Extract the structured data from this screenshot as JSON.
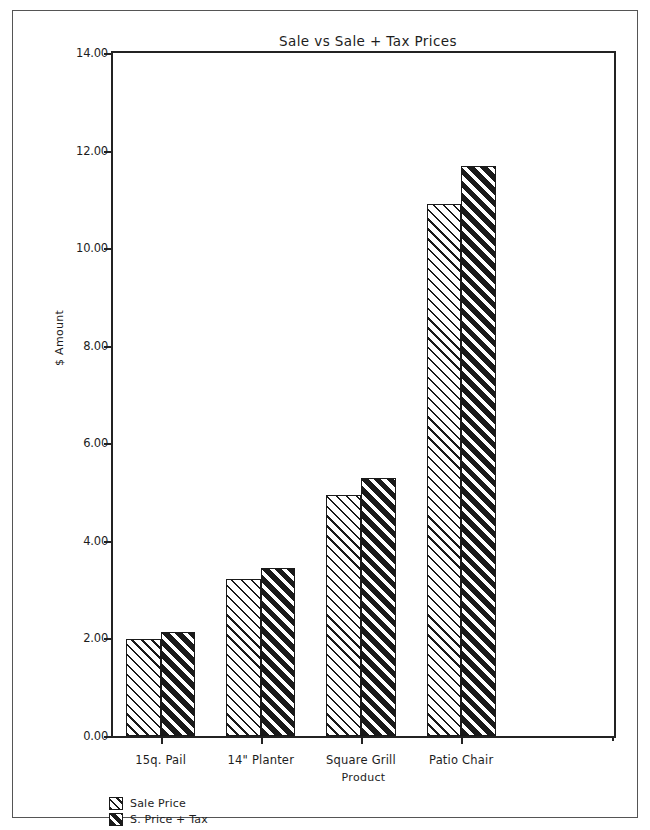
{
  "chart_data": {
    "type": "bar",
    "title": "Sale vs Sale + Tax Prices",
    "xlabel": "Product",
    "ylabel": "$ Amount",
    "categories": [
      "15q. Pail",
      "14\" Planter",
      "Square Grill",
      "Patio Chair"
    ],
    "series": [
      {
        "name": "Sale Price",
        "values": [
          1.99,
          3.22,
          4.95,
          10.9
        ]
      },
      {
        "name": "S. Price + Tax",
        "values": [
          2.14,
          3.44,
          5.28,
          11.68
        ]
      }
    ],
    "ylim": [
      0,
      14
    ],
    "ytick_values": [
      0,
      2,
      4,
      6,
      8,
      10,
      12,
      14
    ],
    "ytick_labels": [
      "0.00",
      "2.00",
      "4.00",
      "6.00",
      "8.00",
      "10.00",
      "12.00",
      "14.00"
    ],
    "grid": false,
    "legend_position": "below-axes-left",
    "colors": {
      "axis": "#232323",
      "text": "#1d1d1d",
      "bar_sale_price": "#ffffff",
      "bar_sale_plus_tax": "#1a1a1a",
      "frame": "#555555"
    }
  }
}
